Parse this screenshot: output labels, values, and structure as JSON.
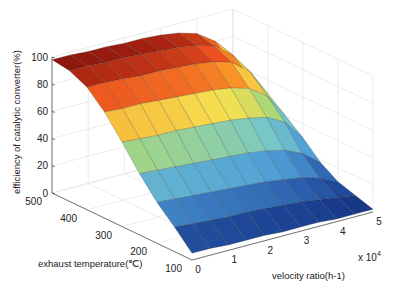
{
  "chart_data": {
    "type": "surface",
    "title": "",
    "xlabel": "velocity ratio(h-1)",
    "xlabel_multiplier": "x 10^4",
    "ylabel": "exhaust temperature(℃)",
    "zlabel": "efficiency of catalytic converter(%)",
    "x_ticks": [
      "0",
      "1",
      "2",
      "3",
      "4",
      "5"
    ],
    "y_ticks": [
      "100",
      "200",
      "300",
      "400",
      "500"
    ],
    "z_ticks": [
      "0",
      "20",
      "40",
      "60",
      "80",
      "100"
    ],
    "xlim": [
      0,
      5
    ],
    "ylim": [
      100,
      500
    ],
    "zlim": [
      0,
      100
    ],
    "grid": true,
    "colormap": "jet-like (blue low, red high)",
    "x": [
      0,
      0.5,
      1,
      1.5,
      2,
      2.5,
      3,
      3.5,
      4,
      4.5,
      5
    ],
    "y": [
      100,
      150,
      200,
      250,
      300,
      350,
      400,
      450,
      500
    ],
    "z_rows_by_temperature": [
      [
        5,
        5,
        4,
        4,
        4,
        3,
        3,
        3,
        2,
        2,
        2
      ],
      [
        18,
        17,
        16,
        15,
        15,
        14,
        13,
        12,
        10,
        8,
        6
      ],
      [
        30,
        29,
        28,
        27,
        26,
        25,
        24,
        22,
        20,
        16,
        10
      ],
      [
        45,
        44,
        43,
        42,
        41,
        40,
        39,
        37,
        34,
        28,
        18
      ],
      [
        62,
        61,
        60,
        60,
        59,
        58,
        57,
        55,
        52,
        45,
        30
      ],
      [
        78,
        77,
        77,
        76,
        75,
        74,
        73,
        71,
        67,
        58,
        40
      ],
      [
        90,
        90,
        89,
        88,
        88,
        87,
        86,
        84,
        80,
        70,
        50
      ],
      [
        96,
        96,
        95,
        95,
        94,
        93,
        92,
        90,
        86,
        76,
        56
      ],
      [
        98,
        98,
        97,
        97,
        96,
        96,
        95,
        93,
        89,
        80,
        60
      ]
    ]
  }
}
